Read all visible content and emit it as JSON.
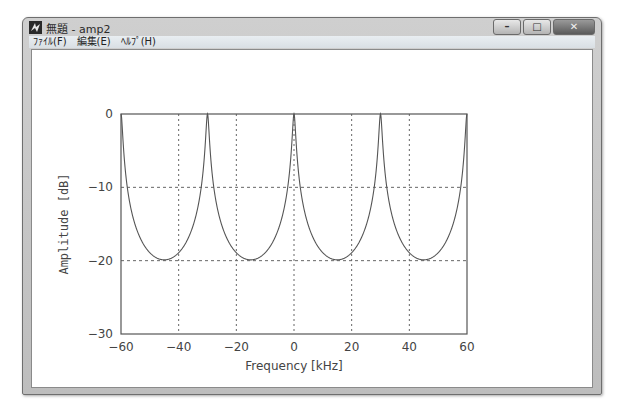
{
  "window": {
    "title": "無題 - amp2",
    "buttons": {
      "minimize": "–",
      "maximize": "□",
      "close": "✕"
    }
  },
  "menubar": {
    "items": [
      {
        "label": "ﾌｧｲﾙ(F)"
      },
      {
        "label": "編集(E)"
      },
      {
        "label": "ﾍﾙﾌﾟ(H)"
      }
    ]
  },
  "chart_data": {
    "type": "line",
    "title": "",
    "xlabel": "Frequency [kHz]",
    "ylabel": "Amplitude [dB]",
    "xlim": [
      -60,
      60
    ],
    "ylim": [
      -30,
      0
    ],
    "xticks": [
      -60,
      -40,
      -20,
      0,
      20,
      40,
      60
    ],
    "yticks": [
      0,
      -10,
      -20,
      -30
    ],
    "grid": true,
    "grid_style": "dotted",
    "series": [
      {
        "name": "amplitude response",
        "description": "periodic comb response, peaks at 0 dB every 30 kHz, minima approx -25.5 dB",
        "period_khz": 30,
        "peaks_khz": [
          -60,
          -30,
          0,
          30,
          60
        ],
        "minima_khz": [
          -45,
          -15,
          15,
          45
        ],
        "min_db": -25.5,
        "x": [
          -60,
          -57,
          -55,
          -52,
          -50,
          -45,
          -40,
          -38,
          -35,
          -33,
          -30,
          -27,
          -25,
          -22,
          -20,
          -15,
          -10,
          -8,
          -5,
          -3,
          0,
          3,
          5,
          8,
          10,
          15,
          20,
          22,
          25,
          27,
          30,
          33,
          35,
          38,
          40,
          45,
          50,
          52,
          55,
          57,
          60
        ],
        "y": [
          0,
          -11.5,
          -16.5,
          -21.5,
          -23.5,
          -25.5,
          -23.5,
          -21.5,
          -16.5,
          -11.5,
          0,
          -11.5,
          -16.5,
          -21.5,
          -23.5,
          -25.5,
          -23.5,
          -21.5,
          -16.5,
          -11.5,
          0,
          -11.5,
          -16.5,
          -21.5,
          -23.5,
          -25.5,
          -23.5,
          -21.5,
          -16.5,
          -11.5,
          0,
          -11.5,
          -16.5,
          -21.5,
          -23.5,
          -25.5,
          -23.5,
          -21.5,
          -16.5,
          -11.5,
          0
        ]
      }
    ]
  }
}
